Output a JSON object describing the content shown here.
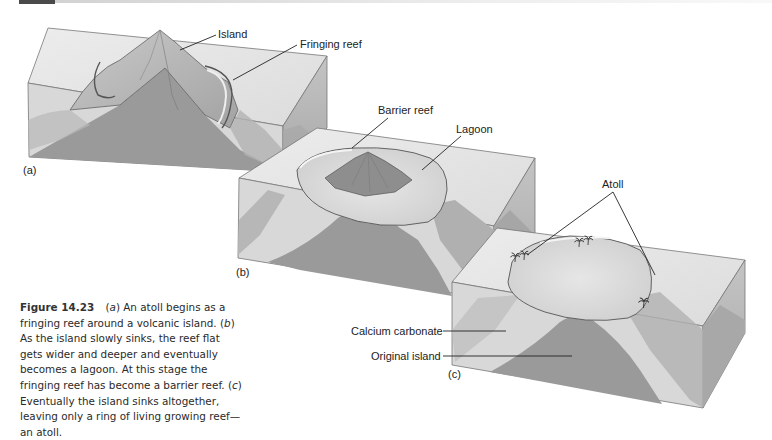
{
  "header": {
    "bar_color": "#4a4a4a",
    "band_color": "#dcdcdc"
  },
  "figure": {
    "panels": [
      {
        "id": "a",
        "marker": "(a)",
        "labels": [
          {
            "text": "Island"
          },
          {
            "text": "Fringing reef"
          }
        ]
      },
      {
        "id": "b",
        "marker": "(b)",
        "labels": [
          {
            "text": "Barrier reef"
          },
          {
            "text": "Lagoon"
          }
        ]
      },
      {
        "id": "c",
        "marker": "(c)",
        "labels": [
          {
            "text": "Atoll"
          },
          {
            "text": "Calcium carbonate"
          },
          {
            "text": "Original island"
          }
        ]
      }
    ],
    "colors": {
      "core": "#9a9a9a",
      "water_top": "#e4e4e4",
      "water_front": "#d6d6d6",
      "water_side": "#b8b8b8",
      "reef": "#cfcfcf",
      "lagoon": "#dadada",
      "outline": "#555555"
    }
  },
  "caption": {
    "figure_number": "Figure 14.23",
    "parts": [
      {
        "marker": "a",
        "text": "An atoll begins as a fringing reef around a volcanic island."
      },
      {
        "marker": "b",
        "text": "As the island slowly sinks, the reef flat gets wider and deeper and eventually becomes a lagoon. At this stage the fringing reef has become a barrier reef."
      },
      {
        "marker": "c",
        "text": "Eventually the island sinks altogether, leaving only a ring of living growing reef—an atoll."
      }
    ]
  }
}
